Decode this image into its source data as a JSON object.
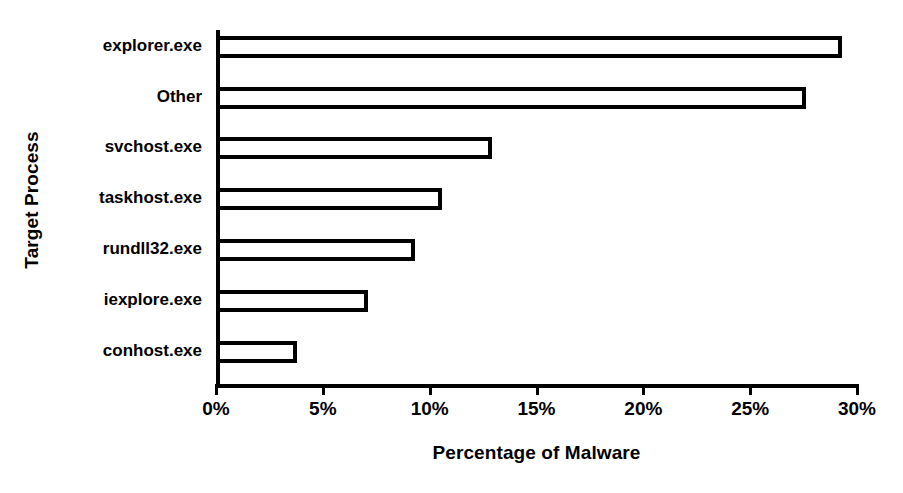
{
  "chart_data": {
    "type": "bar",
    "orientation": "horizontal",
    "title": "",
    "xlabel": "Percentage of Malware",
    "ylabel": "Target Process",
    "categories": [
      "explorer.exe",
      "Other",
      "svchost.exe",
      "taskhost.exe",
      "rundll32.exe",
      "iexplore.exe",
      "conhost.exe"
    ],
    "values": [
      29.3,
      27.6,
      12.9,
      10.6,
      9.3,
      7.1,
      3.8
    ],
    "value_unit": "%",
    "xlim": [
      0,
      30
    ],
    "xticks": [
      0,
      5,
      10,
      15,
      20,
      25,
      30
    ],
    "xtick_labels": [
      "0%",
      "5%",
      "10%",
      "15%",
      "20%",
      "25%",
      "30%"
    ],
    "grid": false,
    "legend": false,
    "bar_fill_color": "#ffffff",
    "bar_edge_color": "#000000",
    "background_color": "#ffffff",
    "text_color": "#000000"
  }
}
